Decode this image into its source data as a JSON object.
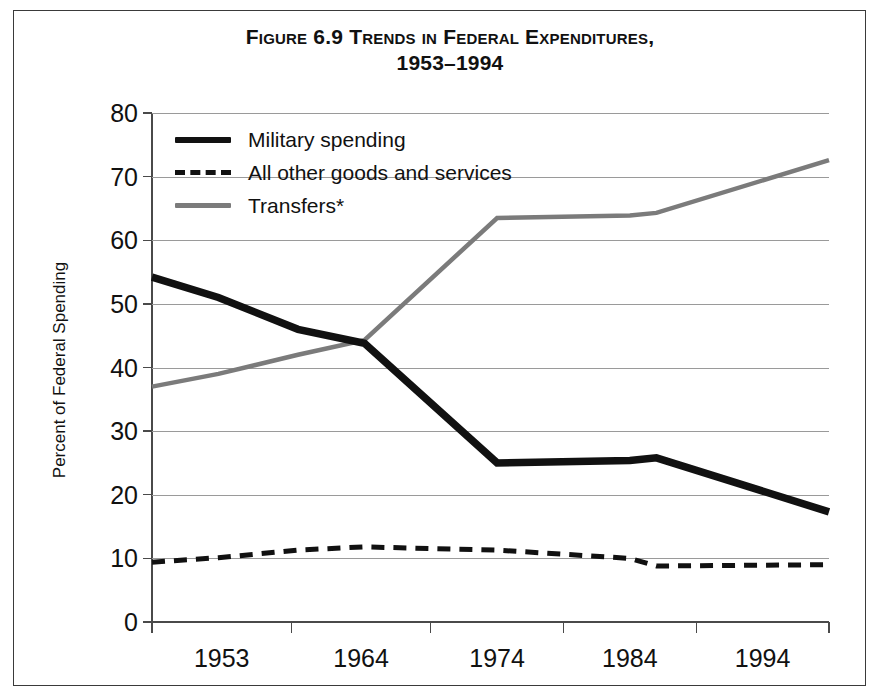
{
  "figure": {
    "title_line1": "Figure 6.9  Trends in Federal Expenditures,",
    "title_line2": "1953–1994"
  },
  "axes": {
    "y_axis_title": "Percent of Federal Spending",
    "y_ticks": [
      "0",
      "10",
      "20",
      "30",
      "40",
      "50",
      "60",
      "70",
      "80"
    ],
    "x_ticks": [
      "1953",
      "1964",
      "1974",
      "1984",
      "1994"
    ]
  },
  "legend": {
    "items": [
      {
        "label": "Military spending",
        "style": "solid-black"
      },
      {
        "label": "All other goods and services",
        "style": "dashed-black"
      },
      {
        "label": "Transfers*",
        "style": "solid-gray"
      }
    ]
  },
  "colors": {
    "military": "#111111",
    "other_goods": "#111111",
    "transfers": "#7b7b7b",
    "gridline": "#9a9a9a",
    "axis": "#4a4a4a",
    "border": "#3a3a3a",
    "background": "#ffffff"
  },
  "chart_data": {
    "type": "line",
    "title": "Figure 6.9  Trends in Federal Expenditures, 1953–1994",
    "xlabel": "",
    "ylabel": "Percent of Federal Spending",
    "ylim": [
      0,
      80
    ],
    "ytick_step": 10,
    "grid": true,
    "legend_position": "top-left inside plot",
    "x_tick_labels": [
      "1953",
      "1964",
      "1974",
      "1984",
      "1994"
    ],
    "x_tick_positions": [
      1953,
      1964,
      1974,
      1984,
      1994
    ],
    "xlim": [
      1948,
      1999
    ],
    "note": "Tick marks are drawn at segment boundaries; year labels are centered between ticks.",
    "series": [
      {
        "name": "Military spending",
        "style": "solid",
        "color": "#111111",
        "x": [
          1948,
          1953,
          1959,
          1964,
          1974,
          1984,
          1986,
          1999
        ],
        "values": [
          54.2,
          51.0,
          46.0,
          43.8,
          25.0,
          25.4,
          25.8,
          17.3
        ]
      },
      {
        "name": "All other goods and services",
        "style": "dashed",
        "color": "#111111",
        "x": [
          1948,
          1953,
          1959,
          1964,
          1974,
          1984,
          1986,
          1999
        ],
        "values": [
          9.4,
          10.1,
          11.3,
          11.8,
          11.3,
          10.0,
          8.8,
          9.0
        ]
      },
      {
        "name": "Transfers*",
        "style": "solid",
        "color": "#7b7b7b",
        "x": [
          1948,
          1953,
          1959,
          1964,
          1974,
          1984,
          1986,
          1999
        ],
        "values": [
          37.0,
          39.0,
          42.0,
          44.3,
          63.5,
          63.9,
          64.3,
          72.6
        ]
      }
    ]
  }
}
